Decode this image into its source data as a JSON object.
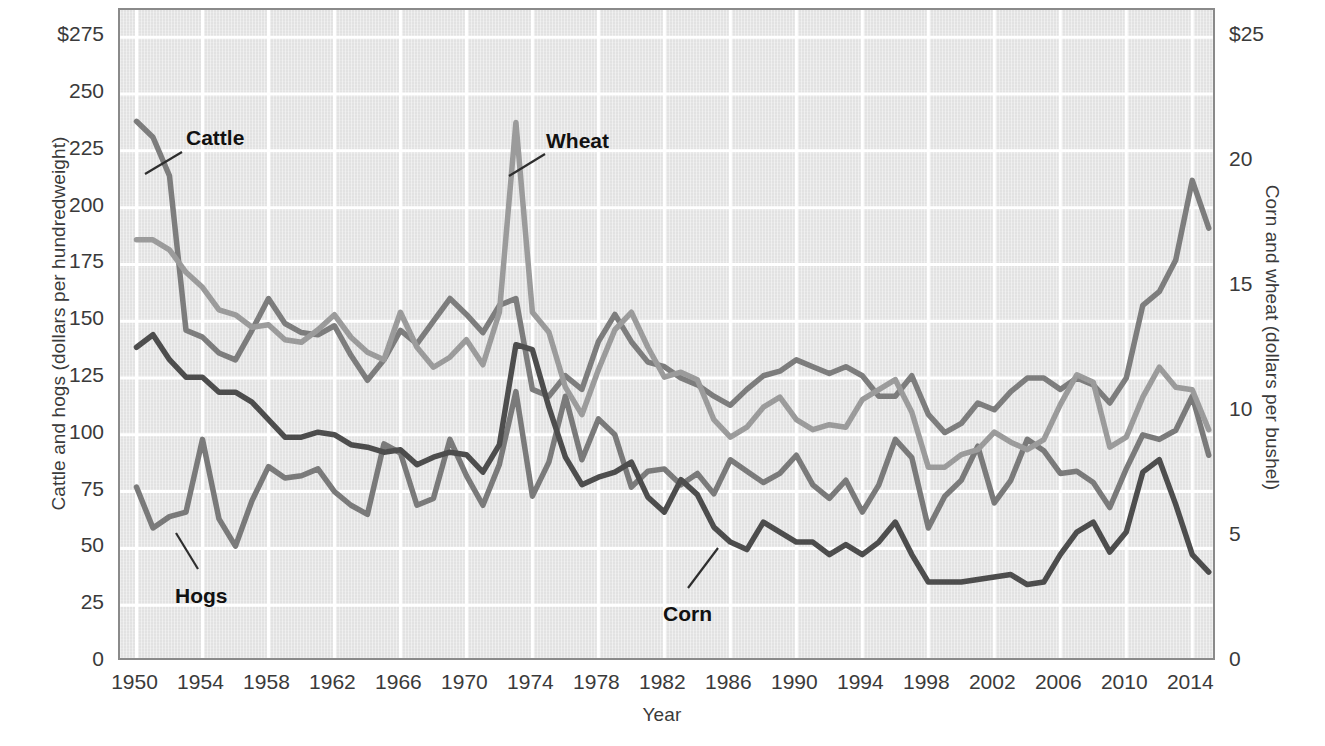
{
  "chart_data": {
    "type": "line",
    "title": "",
    "xlabel": "Year",
    "ylabel": "Cattle and hogs (dollars per hundredweight)",
    "ylabel_right": "Corn and wheat (dollars per bushel)",
    "grid": true,
    "legend_position": "inline-annotations",
    "xlim": [
      1949,
      2015.5
    ],
    "ylim": [
      0,
      287
    ],
    "ylim_right": [
      0,
      26.1
    ],
    "xticks": [
      1950,
      1954,
      1958,
      1962,
      1966,
      1970,
      1974,
      1978,
      1982,
      1986,
      1990,
      1994,
      1998,
      2002,
      2006,
      2010,
      2014
    ],
    "xtick_labels": [
      "1950",
      "1954",
      "1958",
      "1962",
      "1966",
      "1970",
      "1974",
      "1978",
      "1982",
      "1986",
      "1990",
      "1994",
      "1998",
      "2002",
      "2006",
      "2010",
      "2014"
    ],
    "yticks": [
      0,
      25,
      50,
      75,
      100,
      125,
      150,
      175,
      200,
      225,
      250,
      275
    ],
    "ytick_labels": [
      "0",
      "25",
      "50",
      "75",
      "100",
      "125",
      "150",
      "175",
      "200",
      "225",
      "250",
      "$275"
    ],
    "yticks_right": [
      0,
      5,
      10,
      15,
      20,
      25
    ],
    "ytick_labels_right": [
      "0",
      "5",
      "10",
      "15",
      "20",
      "$25"
    ],
    "x": [
      1950,
      1951,
      1952,
      1953,
      1954,
      1955,
      1956,
      1957,
      1958,
      1959,
      1960,
      1961,
      1962,
      1963,
      1964,
      1965,
      1966,
      1967,
      1968,
      1969,
      1970,
      1971,
      1972,
      1973,
      1974,
      1975,
      1976,
      1977,
      1978,
      1979,
      1980,
      1981,
      1982,
      1983,
      1984,
      1985,
      1986,
      1987,
      1988,
      1989,
      1990,
      1991,
      1992,
      1993,
      1994,
      1995,
      1996,
      1997,
      1998,
      1999,
      2000,
      2001,
      2002,
      2003,
      2004,
      2005,
      2006,
      2007,
      2008,
      2009,
      2010,
      2011,
      2012,
      2013,
      2014,
      2015
    ],
    "series": [
      {
        "name": "Cattle",
        "axis": "left",
        "units": "dollars per hundredweight",
        "color": "#7d7d7d",
        "values": [
          238,
          231,
          214,
          146,
          143,
          136,
          133,
          146,
          160,
          149,
          145,
          144,
          148,
          135,
          124,
          133,
          146,
          140,
          150,
          160,
          153,
          145,
          157,
          160,
          120,
          117,
          126,
          120,
          141,
          153,
          141,
          132,
          130,
          125,
          122,
          117,
          113,
          120,
          126,
          128,
          133,
          130,
          127,
          130,
          126,
          117,
          117,
          126,
          109,
          101,
          105,
          114,
          111,
          119,
          125,
          125,
          120,
          125,
          122,
          114,
          125,
          157,
          163,
          177,
          212,
          191
        ]
      },
      {
        "name": "Hogs",
        "axis": "left",
        "units": "dollars per hundredweight",
        "color": "#7a7a7a",
        "values": [
          77,
          59,
          64,
          66,
          98,
          63,
          51,
          71,
          86,
          81,
          82,
          85,
          75,
          69,
          65,
          96,
          92,
          69,
          72,
          98,
          82,
          69,
          87,
          119,
          73,
          88,
          117,
          89,
          107,
          100,
          77,
          84,
          85,
          78,
          83,
          74,
          89,
          84,
          79,
          83,
          91,
          78,
          72,
          80,
          66,
          78,
          98,
          90,
          59,
          73,
          80,
          95,
          70,
          80,
          98,
          93,
          83,
          84,
          79,
          68,
          85,
          100,
          98,
          102,
          117,
          91
        ]
      },
      {
        "name": "Wheat",
        "axis": "right",
        "units": "dollars per bushel",
        "color": "#9b9b9b",
        "values": [
          16.9,
          16.9,
          16.5,
          15.6,
          15.0,
          14.1,
          13.9,
          13.4,
          13.5,
          12.9,
          12.8,
          13.3,
          13.9,
          13.0,
          12.4,
          12.1,
          14.0,
          12.6,
          11.8,
          12.2,
          12.9,
          11.9,
          14.0,
          21.6,
          14.0,
          13.2,
          11.0,
          9.9,
          11.7,
          13.3,
          14.0,
          12.6,
          11.4,
          11.6,
          11.3,
          9.7,
          9.0,
          9.4,
          10.2,
          10.6,
          9.7,
          9.3,
          9.5,
          9.4,
          10.5,
          10.9,
          11.3,
          10.0,
          7.8,
          7.8,
          8.3,
          8.5,
          9.2,
          8.8,
          8.5,
          8.9,
          10.3,
          11.5,
          11.2,
          8.6,
          9.0,
          10.6,
          11.8,
          11.0,
          10.9,
          9.3
        ]
      },
      {
        "name": "Corn",
        "axis": "right",
        "units": "dollars per bushel",
        "color": "#4d4d4d",
        "values": [
          12.6,
          13.1,
          12.1,
          11.4,
          11.4,
          10.8,
          10.8,
          10.4,
          9.7,
          9.0,
          9.0,
          9.2,
          9.1,
          8.7,
          8.6,
          8.4,
          8.5,
          7.9,
          8.2,
          8.4,
          8.3,
          7.6,
          8.7,
          12.7,
          12.5,
          10.2,
          8.2,
          7.1,
          7.4,
          7.6,
          8.0,
          6.6,
          6.0,
          7.3,
          6.7,
          5.4,
          4.8,
          4.5,
          5.6,
          5.2,
          4.8,
          4.8,
          4.3,
          4.7,
          4.3,
          4.8,
          5.6,
          4.3,
          3.2,
          3.2,
          3.2,
          3.3,
          3.4,
          3.5,
          3.1,
          3.2,
          4.3,
          5.2,
          5.6,
          4.4,
          5.2,
          7.6,
          8.1,
          6.3,
          4.3,
          3.6
        ]
      }
    ],
    "annotations": [
      {
        "label": "Cattle",
        "series": "Cattle",
        "x_px": 186,
        "y_px": 126,
        "leader_from_x": 180,
        "leader_from_y": 150,
        "leader_to_x": 143,
        "leader_to_y": 172
      },
      {
        "label": "Wheat",
        "series": "Wheat",
        "x_px": 546,
        "y_px": 129,
        "leader_from_x": 543,
        "leader_from_y": 152,
        "leader_to_x": 507,
        "leader_to_y": 174
      },
      {
        "label": "Hogs",
        "series": "Hogs",
        "x_px": 175,
        "y_px": 584,
        "leader_from_x": 196,
        "leader_from_y": 567,
        "leader_to_x": 174,
        "leader_to_y": 531
      },
      {
        "label": "Corn",
        "series": "Corn",
        "x_px": 663,
        "y_px": 602,
        "leader_from_x": 686,
        "leader_from_y": 586,
        "leader_to_x": 716,
        "leader_to_y": 546
      }
    ],
    "colors": {
      "plot_background": "#e2e2e2",
      "gridline": "#ffffff",
      "frame": "#8a8a8a",
      "text": "#3a3a3a",
      "annotation_text": "#111111"
    }
  }
}
